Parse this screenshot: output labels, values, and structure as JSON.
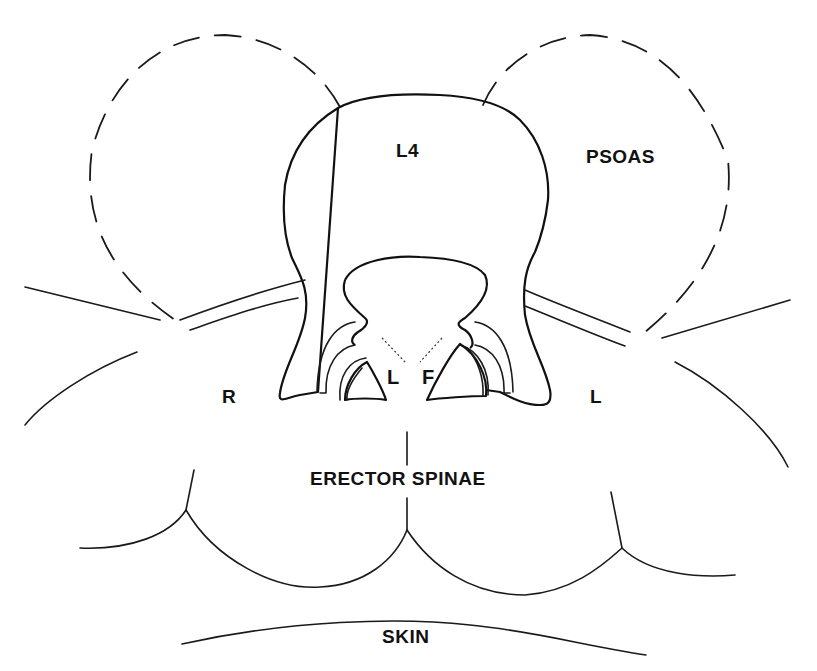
{
  "diagram": {
    "type": "anatomical cross-section",
    "labels": {
      "vertebra": "L4",
      "psoas": "PSOAS",
      "right_side": "R",
      "left_side": "L",
      "ligamentum": "L",
      "facet": "F",
      "erector_spinae": "ERECTOR SPINAE",
      "skin": "SKIN"
    },
    "colors": {
      "stroke": "#1a1a1a",
      "background": "#ffffff"
    }
  }
}
